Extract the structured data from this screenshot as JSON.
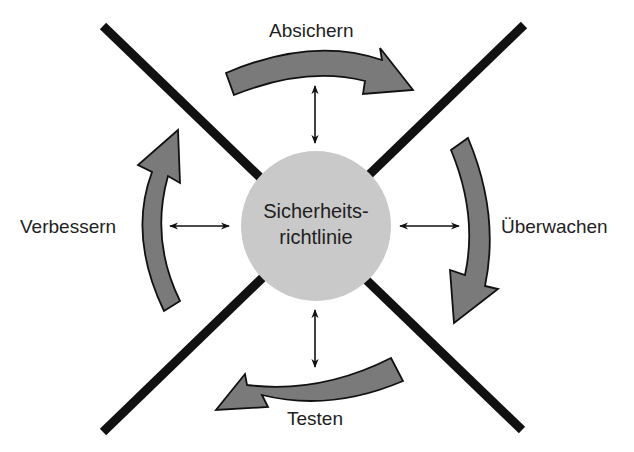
{
  "diagram": {
    "type": "cycle",
    "colors": {
      "background": "#ffffff",
      "cross_lines": "#111111",
      "circle_fill": "#c9c9c9",
      "curved_arrow_fill": "#7a7a7a",
      "curved_arrow_stroke": "#111111",
      "connector": "#111111",
      "text": "#222222"
    },
    "center": {
      "line1": "Sicherheits-",
      "line2": "richtlinie"
    },
    "stages": [
      {
        "id": "top",
        "label": "Absichern",
        "direction": "clockwise"
      },
      {
        "id": "right",
        "label": "Überwachen",
        "direction": "clockwise"
      },
      {
        "id": "bottom",
        "label": "Testen",
        "direction": "clockwise"
      },
      {
        "id": "left",
        "label": "Verbessern",
        "direction": "clockwise"
      }
    ],
    "connectors": [
      {
        "between": [
          "Sicherheitsrichtlinie",
          "Absichern"
        ],
        "style": "double-arrow"
      },
      {
        "between": [
          "Sicherheitsrichtlinie",
          "Überwachen"
        ],
        "style": "double-arrow"
      },
      {
        "between": [
          "Sicherheitsrichtlinie",
          "Testen"
        ],
        "style": "double-arrow"
      },
      {
        "between": [
          "Sicherheitsrichtlinie",
          "Verbessern"
        ],
        "style": "double-arrow"
      }
    ]
  }
}
